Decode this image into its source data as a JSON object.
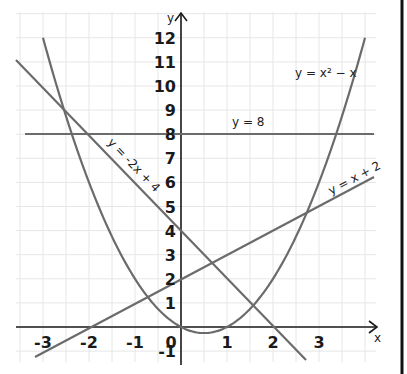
{
  "chart_data": {
    "type": "line",
    "title": "",
    "xlabel": "x",
    "ylabel": "y",
    "xlim": [
      -3.6,
      4.3
    ],
    "ylim": [
      -1.4,
      12.6
    ],
    "grid": true,
    "x_ticks": [
      "-3",
      "-2",
      "-1",
      "0",
      "1",
      "2",
      "3"
    ],
    "y_ticks": [
      "-1",
      "1",
      "2",
      "3",
      "4",
      "5",
      "6",
      "7",
      "8",
      "9",
      "10",
      "11",
      "12"
    ],
    "series": [
      {
        "name": "y = x² − x",
        "kind": "parabola",
        "x": [
          -3,
          -2,
          -1,
          0,
          0.5,
          1,
          2,
          3,
          4
        ],
        "y": [
          12,
          6,
          2,
          0,
          -0.25,
          0,
          2,
          6,
          12
        ]
      },
      {
        "name": "y = -2x + 4",
        "kind": "line",
        "x": [
          -3.6,
          2.7
        ],
        "y": [
          11.2,
          -1.4
        ]
      },
      {
        "name": "y = x + 2",
        "kind": "line",
        "x": [
          -3.2,
          4.2
        ],
        "y": [
          -1.2,
          6.2
        ]
      },
      {
        "name": "y = 8",
        "kind": "line",
        "x": [
          -3.4,
          4.2
        ],
        "y": [
          8,
          8
        ]
      }
    ],
    "annotations": [
      "y = x² − x",
      "y = 8",
      "y = -2x + 4",
      "y = x + 2"
    ]
  },
  "labels": {
    "parabola": "y = x² − x",
    "horizontal": "y = 8",
    "decreasing": "y = -2x + 4",
    "increasing": "y = x + 2",
    "x_axis": "x",
    "y_axis": "y"
  }
}
